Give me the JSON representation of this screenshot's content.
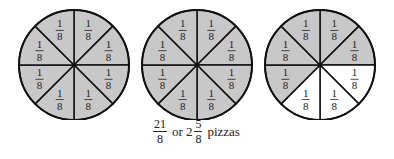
{
  "pizzas": [
    {
      "cx": 74,
      "cy": 65,
      "r": 55,
      "slices": 8,
      "shaded": [
        true,
        true,
        true,
        true,
        true,
        true,
        true,
        true
      ],
      "label": "1/8"
    },
    {
      "cx": 197,
      "cy": 65,
      "r": 55,
      "slices": 8,
      "shaded": [
        true,
        true,
        true,
        true,
        true,
        true,
        true,
        true
      ],
      "label": "1/8"
    },
    {
      "cx": 320,
      "cy": 65,
      "r": 55,
      "slices": 8,
      "shaded": [
        true,
        true,
        false,
        false,
        false,
        true,
        true,
        true
      ],
      "label": "1/8"
    }
  ],
  "slice_label": {
    "num": "1",
    "den": "8"
  },
  "colors": {
    "shaded": "#c8c8c8",
    "unshaded": "#ffffff",
    "stroke": "#111111"
  },
  "caption": {
    "improper": {
      "num": "21",
      "den": "8"
    },
    "or": "or",
    "whole": "2",
    "mixed": {
      "num": "5",
      "den": "8"
    },
    "unit": "pizzas"
  }
}
